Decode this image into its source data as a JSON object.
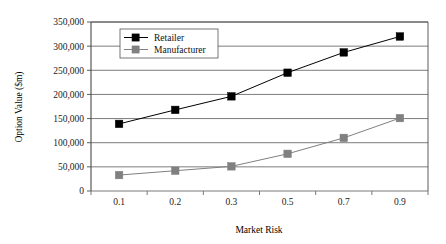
{
  "chart_data": {
    "type": "line",
    "title": "",
    "xlabel": "Market Risk",
    "ylabel": "Option Value  ($m)",
    "categories": [
      "0.1",
      "0.2",
      "0.3",
      "0.5",
      "0.7",
      "0.9"
    ],
    "ylim": [
      0,
      350000
    ],
    "ytick_step": 50000,
    "ytick_labels": [
      "0",
      "50,000",
      "100,000",
      "150,000",
      "200,000",
      "250,000",
      "300,000",
      "350,000"
    ],
    "ytick_values": [
      0,
      50000,
      100000,
      150000,
      200000,
      250000,
      300000,
      350000
    ],
    "grid": true,
    "grid_axis": "y",
    "legend_position": "upper-left-inside",
    "series": [
      {
        "name": "Retailer",
        "marker": "filled-square",
        "color": "#000000",
        "line_color": "#000000",
        "values": [
          139000,
          168000,
          196000,
          245000,
          287000,
          320000
        ]
      },
      {
        "name": "Manufacturer",
        "marker": "filled-square",
        "color": "#808080",
        "line_color": "#808080",
        "values": [
          33000,
          42000,
          51000,
          77000,
          110000,
          151000
        ]
      }
    ]
  },
  "legend": {
    "items": [
      {
        "label": "Retailer"
      },
      {
        "label": "Manufacturer"
      }
    ]
  },
  "axes": {
    "x_title": "Market Risk",
    "y_title": "Option Value  ($m)"
  }
}
